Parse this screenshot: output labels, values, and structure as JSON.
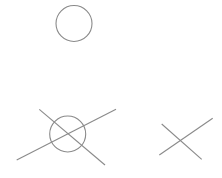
{
  "canvas": {
    "width": 222,
    "height": 178,
    "background": "#ffffff"
  },
  "style": {
    "stroke": "#8a8a8a",
    "stroke_width": 1.1
  },
  "figures": [
    {
      "name": "circle-alone",
      "circles": [
        {
          "cx": 74,
          "cy": 23.5,
          "r": 18
        }
      ],
      "lines": []
    },
    {
      "name": "circle-with-crossing-lines",
      "circles": [
        {
          "cx": 67.7,
          "cy": 134,
          "r": 18
        }
      ],
      "lines": [
        {
          "x1": 16.7,
          "y1": 160,
          "x2": 116,
          "y2": 109.3
        },
        {
          "x1": 39.3,
          "y1": 109.3,
          "x2": 105,
          "y2": 165
        }
      ]
    },
    {
      "name": "crossing-lines",
      "circles": [],
      "lines": [
        {
          "x1": 159.3,
          "y1": 155,
          "x2": 212.7,
          "y2": 118.3
        },
        {
          "x1": 161.7,
          "y1": 124,
          "x2": 201.7,
          "y2": 159.3
        }
      ]
    }
  ]
}
